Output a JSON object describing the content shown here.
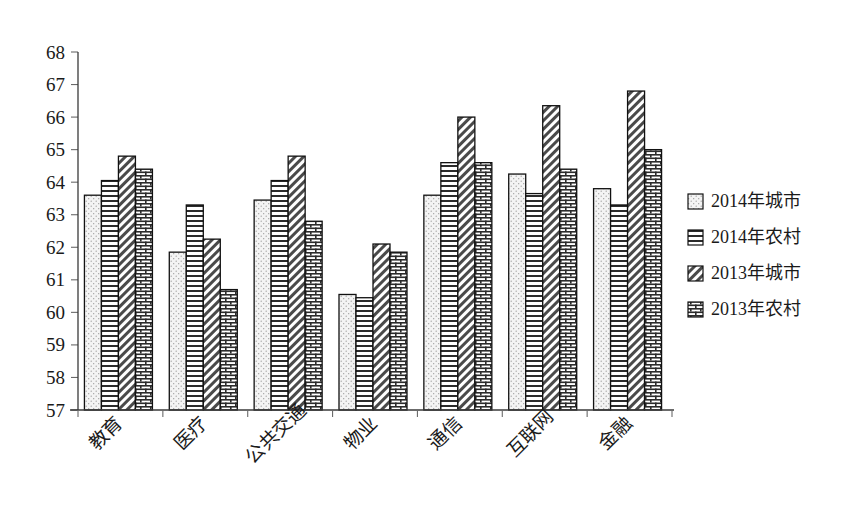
{
  "chart_data": {
    "type": "bar",
    "title": "",
    "subtitle": "",
    "xlabel": "",
    "ylabel": "",
    "ylim": [
      57,
      68
    ],
    "ytick_step": 1,
    "yticks": [
      57,
      58,
      59,
      60,
      61,
      62,
      63,
      64,
      65,
      66,
      67,
      68
    ],
    "grid": false,
    "legend_position": "right",
    "categories": [
      "教育",
      "医疗",
      "公共交通",
      "物业",
      "通信",
      "互联网",
      "金融"
    ],
    "series": [
      {
        "name": "2014年城市",
        "pattern": "dots",
        "color": "#f2f2f2",
        "values": [
          63.6,
          61.85,
          63.45,
          60.55,
          63.6,
          64.25,
          63.8
        ]
      },
      {
        "name": "2014年农村",
        "pattern": "horizontal-lines",
        "color": "#ffffff",
        "values": [
          64.05,
          63.3,
          64.05,
          60.45,
          64.6,
          63.65,
          63.3
        ]
      },
      {
        "name": "2013年城市",
        "pattern": "diagonal-hatch",
        "color": "#ffffff",
        "values": [
          64.8,
          62.25,
          64.8,
          62.1,
          66.0,
          66.35,
          66.8
        ]
      },
      {
        "name": "2013年农村",
        "pattern": "brick-crosshatch",
        "color": "#ffffff",
        "values": [
          64.4,
          60.7,
          62.8,
          61.85,
          64.6,
          64.4,
          65.0
        ]
      }
    ]
  },
  "legend": {
    "items": [
      {
        "label": "2014年城市"
      },
      {
        "label": "2014年农村"
      },
      {
        "label": "2013年城市"
      },
      {
        "label": "2013年农村"
      }
    ]
  },
  "colors": {
    "background": "#ffffff",
    "axis": "#3a3a3a",
    "bar_outline": "#111111",
    "text": "#1a1a1a"
  }
}
